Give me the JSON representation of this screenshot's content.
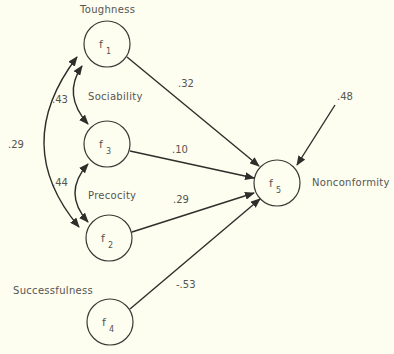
{
  "colors": {
    "background": "#fdfdf0",
    "ink": "#2e2e2a",
    "text": "#555550"
  },
  "nodes": [
    {
      "id": "f1",
      "symbol": "f",
      "subscript": "1",
      "label": "Toughness",
      "cx": 107,
      "cy": 44
    },
    {
      "id": "f3",
      "symbol": "f",
      "subscript": "3",
      "label": "Sociability",
      "cx": 107,
      "cy": 144
    },
    {
      "id": "f2",
      "symbol": "f",
      "subscript": "2",
      "label": "Precocity",
      "cx": 109,
      "cy": 238
    },
    {
      "id": "f4",
      "symbol": "f",
      "subscript": "4",
      "label": "Successfulness",
      "cx": 110,
      "cy": 322
    },
    {
      "id": "f5",
      "symbol": "f",
      "subscript": "5",
      "label": "Nonconformity",
      "cx": 277,
      "cy": 183
    }
  ],
  "paths": [
    {
      "from": "f1",
      "to": "f5",
      "coefficient": ".32"
    },
    {
      "from": "f3",
      "to": "f5",
      "coefficient": ".10"
    },
    {
      "from": "f2",
      "to": "f5",
      "coefficient": ".29"
    },
    {
      "from": "f4",
      "to": "f5",
      "coefficient": "-.53"
    }
  ],
  "correlations": [
    {
      "between": [
        "f1",
        "f3"
      ],
      "coefficient": ".43"
    },
    {
      "between": [
        "f3",
        "f2"
      ],
      "coefficient": ".44"
    },
    {
      "between": [
        "f1",
        "f2"
      ],
      "coefficient": ".29"
    }
  ],
  "residual": {
    "to": "f5",
    "coefficient": ".48"
  }
}
